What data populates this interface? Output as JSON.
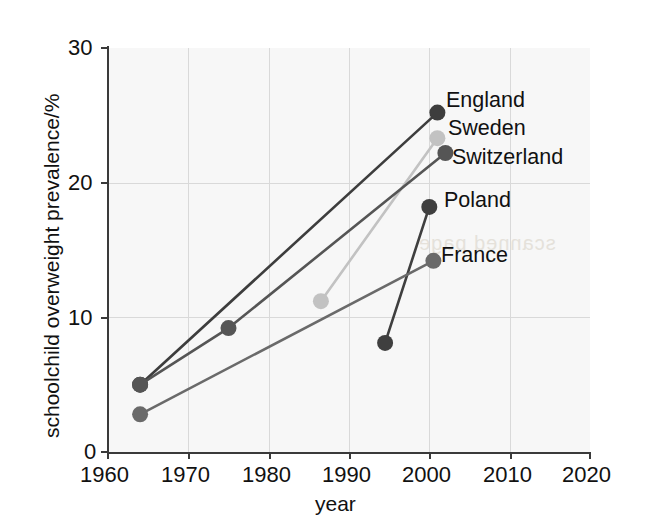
{
  "chart_data": {
    "type": "line",
    "title": "",
    "xlabel": "year",
    "ylabel": "schoolchild overweight prevalence/%",
    "xlim": [
      1960,
      2020
    ],
    "ylim": [
      0,
      30
    ],
    "xticks": [
      1960,
      1970,
      1980,
      1990,
      2000,
      2010,
      2020
    ],
    "yticks": [
      0,
      10,
      20,
      30
    ],
    "grid": true,
    "legend_position": "inline-right-of-endpoint",
    "series": [
      {
        "name": "England",
        "color": "#3d3d3d",
        "label_color": "#111111",
        "points": [
          {
            "x": 1964,
            "y": 5.0
          },
          {
            "x": 2001,
            "y": 25.2
          }
        ]
      },
      {
        "name": "Sweden",
        "color": "#c2c2c2",
        "label_color": "#111111",
        "points": [
          {
            "x": 1986.5,
            "y": 11.2
          },
          {
            "x": 2001,
            "y": 23.3
          }
        ]
      },
      {
        "name": "Switzerland",
        "color": "#555555",
        "label_color": "#111111",
        "points": [
          {
            "x": 1964,
            "y": 5.0
          },
          {
            "x": 1975,
            "y": 9.2
          },
          {
            "x": 2002,
            "y": 22.2
          }
        ]
      },
      {
        "name": "Poland",
        "color": "#3f3f3f",
        "label_color": "#111111",
        "points": [
          {
            "x": 1994.5,
            "y": 8.1
          },
          {
            "x": 2000,
            "y": 18.2
          }
        ]
      },
      {
        "name": "France",
        "color": "#6a6a6a",
        "label_color": "#111111",
        "points": [
          {
            "x": 1964,
            "y": 2.8
          },
          {
            "x": 2000.5,
            "y": 14.2
          }
        ]
      }
    ],
    "xtick_labels": [
      "1960",
      "1970",
      "1980",
      "1990",
      "2000",
      "2010",
      "2020"
    ],
    "ytick_labels": [
      "0",
      "10",
      "20",
      "30"
    ]
  },
  "axes": {
    "x_title": "year",
    "y_title": "schoolchild overweight prevalence/%"
  },
  "series_labels": {
    "england": "England",
    "sweden": "Sweden",
    "switzerland": "Switzerland",
    "poland": "Poland",
    "france": "France"
  },
  "ticks": {
    "y": {
      "t30": "30",
      "t20": "20",
      "t10": "10",
      "t0": "0"
    },
    "x": {
      "t1960": "1960",
      "t1970": "1970",
      "t1980": "1980",
      "t1990": "1990",
      "t2000": "2000",
      "t2010": "2010",
      "t2020": "2020"
    }
  },
  "artifacts": {
    "bleed_through_text": "scanned page"
  },
  "colors": {
    "background": "#ffffff",
    "plot_background": "#f7f7f7",
    "axis": "#3a3a3a",
    "grid": "#d9d9d9",
    "england": "#3d3d3d",
    "sweden": "#c2c2c2",
    "switzerland": "#555555",
    "poland": "#3f3f3f",
    "france": "#6a6a6a",
    "text": "#111111"
  }
}
